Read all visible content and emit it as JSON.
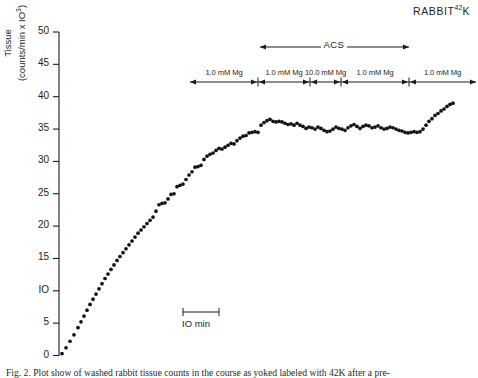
{
  "figure": {
    "title_main": "RABBIT",
    "title_isotope_mass": "42",
    "title_isotope_symbol": "K",
    "title_full": "RABBIT 42K",
    "background_color": "#ffffff",
    "ink_color": "#1a1a1a"
  },
  "axes": {
    "y_label_line1": "Tissue",
    "y_label_line2_pre": "(counts/min x IO",
    "y_label_line2_sup": "3",
    "y_label_line2_post": ")",
    "y_ticks": [
      "0",
      "5",
      "IO",
      "15",
      "20",
      "25",
      "30",
      "35",
      "40",
      "45",
      "50"
    ],
    "y_tick_values": [
      0,
      5,
      10,
      15,
      20,
      25,
      30,
      35,
      40,
      45,
      50
    ],
    "y_min": 0,
    "y_max": 50,
    "x_axis_visible": false,
    "grid": false
  },
  "annotations": {
    "acs": {
      "label": "ACS",
      "arrow_type": "double-headed",
      "x_start_px": 260,
      "x_end_px": 409,
      "y_px": 47
    },
    "scale_bar": {
      "label": "IO min",
      "x_start_px": 183,
      "x_end_px": 219,
      "y_px": 312
    },
    "treatment_bar": {
      "y_px": 82,
      "x_start_px": 190,
      "x_end_px": 476,
      "segments": [
        {
          "label": "1.0 mM Mg",
          "concentration_mM": 1.0,
          "x_start_px": 190,
          "x_end_px": 258
        },
        {
          "label": "1.0  mM Mg",
          "concentration_mM": 1.0,
          "x_start_px": 258,
          "x_end_px": 310
        },
        {
          "label": "10.0 mM Mg",
          "concentration_mM": 10.0,
          "x_start_px": 310,
          "x_end_px": 341
        },
        {
          "label": "1.0 mM Mg",
          "concentration_mM": 1.0,
          "x_start_px": 341,
          "x_end_px": 409
        },
        {
          "label": "1.0 mM Mg",
          "concentration_mM": 1.0,
          "x_start_px": 409,
          "x_end_px": 476
        }
      ]
    }
  },
  "caption": {
    "text": "Fig. 2.  Plot show of washed rabbit tissue counts in the course as yoked labeled with 42K after a pre-"
  },
  "chart_data": {
    "type": "scatter",
    "xlabel": "",
    "ylabel": "Tissue (counts/min x 10^3)",
    "ylim": [
      0,
      50
    ],
    "xlim_px": [
      59,
      476
    ],
    "grid": false,
    "legend": "none",
    "marker": "filled-circle",
    "marker_color": "#111111",
    "x_units": "minutes (10 min = 36 px)",
    "series": [
      {
        "name": "Tissue counts",
        "x_px": [
          62,
          66,
          70,
          74,
          78,
          81,
          84,
          87,
          90,
          93,
          96,
          99,
          102,
          105,
          108,
          111,
          114,
          117,
          120,
          123,
          126,
          129,
          132,
          135,
          138,
          141,
          144,
          147,
          150,
          153,
          156,
          159,
          162,
          165,
          168,
          171,
          174,
          177,
          180,
          183,
          186,
          189,
          192,
          195,
          198,
          201,
          204,
          207,
          210,
          213,
          216,
          219,
          222,
          225,
          228,
          231,
          234,
          237,
          240,
          243,
          246,
          249,
          252,
          255,
          258,
          261,
          264,
          267,
          270,
          273,
          276,
          279,
          282,
          285,
          288,
          291,
          294,
          297,
          300,
          303,
          306,
          309,
          312,
          315,
          318,
          321,
          324,
          327,
          330,
          333,
          336,
          339,
          342,
          345,
          348,
          351,
          354,
          357,
          360,
          363,
          366,
          369,
          372,
          375,
          378,
          381,
          384,
          387,
          390,
          393,
          396,
          399,
          402,
          405,
          408,
          411,
          414,
          417,
          420,
          423,
          426,
          429,
          432,
          435,
          438,
          441,
          444,
          447,
          450,
          453,
          456,
          459
        ],
        "values": [
          0.3,
          1.2,
          2.2,
          3.2,
          4.3,
          5.2,
          6.1,
          7.0,
          7.9,
          8.7,
          9.5,
          10.3,
          11.1,
          11.9,
          12.6,
          13.3,
          14.0,
          14.7,
          15.3,
          15.9,
          16.5,
          17.1,
          17.7,
          18.3,
          18.9,
          19.4,
          19.9,
          20.4,
          20.9,
          21.4,
          22.3,
          23.3,
          23.5,
          23.6,
          24.2,
          24.9,
          25.0,
          26.1,
          26.3,
          26.5,
          27.2,
          27.9,
          28.4,
          29.1,
          29.2,
          29.4,
          30.3,
          30.8,
          31.1,
          31.3,
          31.7,
          32.0,
          31.9,
          32.2,
          32.5,
          32.8,
          32.7,
          33.2,
          33.6,
          33.9,
          34.0,
          34.4,
          34.5,
          34.6,
          34.5,
          35.6,
          36.0,
          36.3,
          36.5,
          36.2,
          36.1,
          36.2,
          36.1,
          35.9,
          35.7,
          35.8,
          35.6,
          35.9,
          35.6,
          35.4,
          35.1,
          35.3,
          35.2,
          35.0,
          35.3,
          35.1,
          34.8,
          34.6,
          34.7,
          35.0,
          35.3,
          35.1,
          35.0,
          34.8,
          35.2,
          35.5,
          35.7,
          35.4,
          35.1,
          35.4,
          35.6,
          35.5,
          35.2,
          35.3,
          35.5,
          35.2,
          35.0,
          35.1,
          35.3,
          35.2,
          35.0,
          34.8,
          34.7,
          34.5,
          34.4,
          34.5,
          34.6,
          34.5,
          34.6,
          35.0,
          35.6,
          36.2,
          36.6,
          37.1,
          37.4,
          37.8,
          38.1,
          38.5,
          38.8,
          39.0
        ]
      }
    ]
  }
}
